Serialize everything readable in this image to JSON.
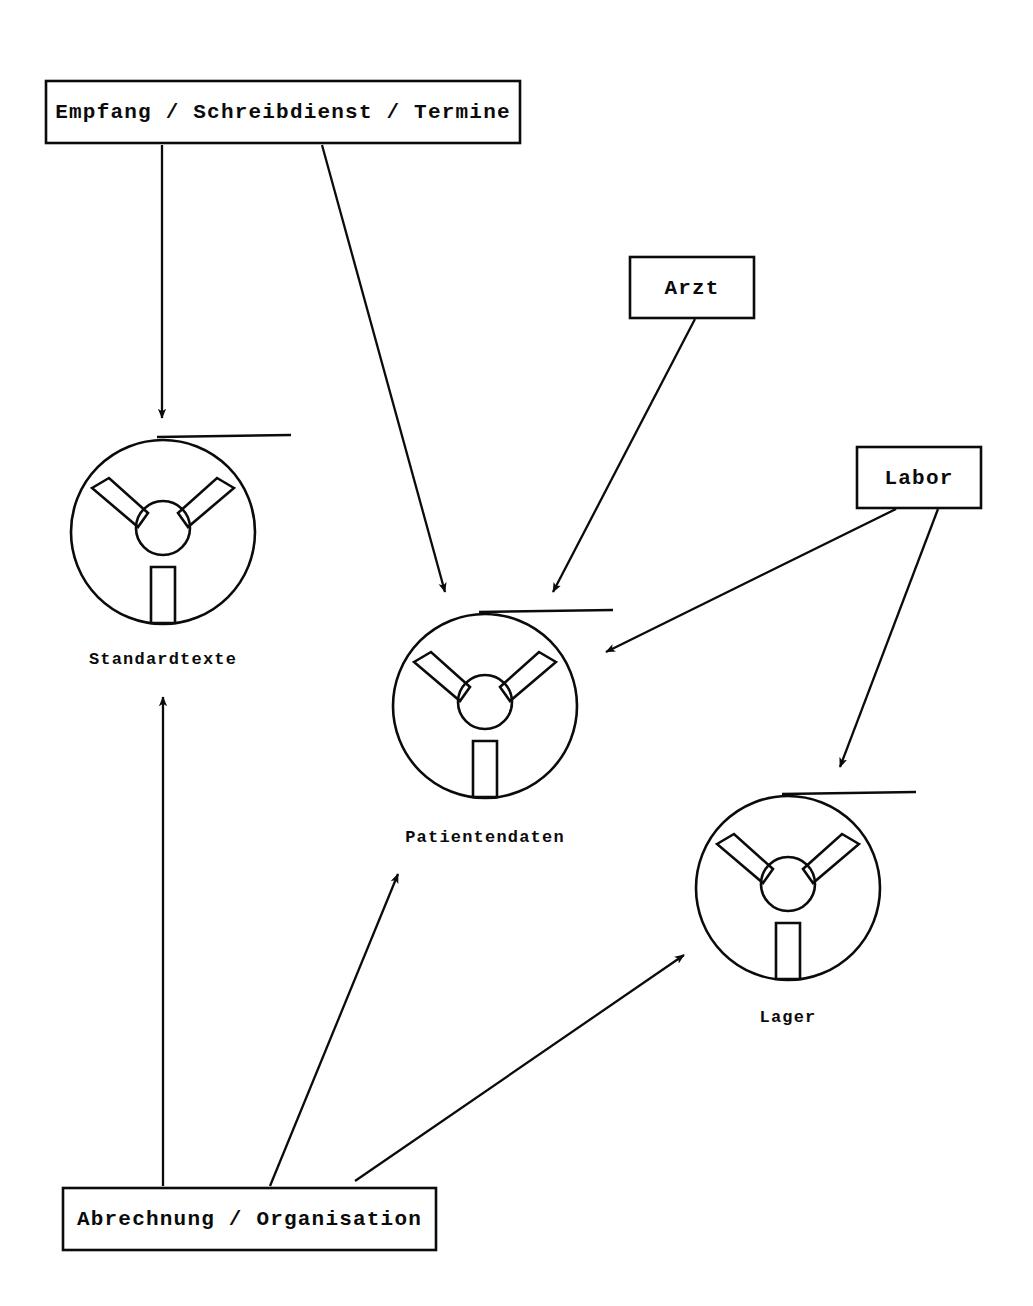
{
  "diagram": {
    "type": "data-flow-diagram",
    "language": "de",
    "background_color": "#ffffff",
    "line_color": "#0b0b0b",
    "processes": [
      {
        "id": "empfang",
        "label": "Empfang / Schreibdienst / Termine",
        "shape": "rectangle",
        "x": 46,
        "y": 81,
        "width": 474,
        "height": 62
      },
      {
        "id": "arzt",
        "label": "Arzt",
        "shape": "rectangle",
        "x": 630,
        "y": 257,
        "width": 124,
        "height": 61
      },
      {
        "id": "labor",
        "label": "Labor",
        "shape": "rectangle",
        "x": 857,
        "y": 447,
        "width": 124,
        "height": 61
      },
      {
        "id": "abrechnung",
        "label": "Abrechnung / Organisation",
        "shape": "rectangle",
        "x": 63,
        "y": 1188,
        "width": 373,
        "height": 62
      }
    ],
    "data_stores": [
      {
        "id": "standardtexte",
        "label": "Standardtexte",
        "shape": "tape-reel",
        "cx": 163,
        "cy": 532,
        "r": 92,
        "tape_from_x": 157,
        "tape_to_x": 291,
        "tape_y": 437,
        "label_x": 163,
        "label_y": 665
      },
      {
        "id": "patientendaten",
        "label": "Patientendaten",
        "shape": "tape-reel",
        "cx": 485,
        "cy": 706,
        "r": 92,
        "tape_from_x": 479,
        "tape_to_x": 613,
        "tape_y": 612,
        "label_x": 485,
        "label_y": 843
      },
      {
        "id": "lager",
        "label": "Lager",
        "shape": "tape-reel",
        "cx": 788,
        "cy": 888,
        "r": 92,
        "tape_from_x": 782,
        "tape_to_x": 916,
        "tape_y": 794,
        "label_x": 788,
        "label_y": 1023
      }
    ],
    "flows": [
      {
        "id": "flow-empfang-standardtexte",
        "from": "empfang",
        "to": "standardtexte",
        "x1": 162,
        "y1": 145,
        "x2": 162,
        "y2": 418
      },
      {
        "id": "flow-empfang-patientendaten",
        "from": "empfang",
        "to": "patientendaten",
        "x1": 322,
        "y1": 145,
        "x2": 445,
        "y2": 592
      },
      {
        "id": "flow-arzt-patientendaten",
        "from": "arzt",
        "to": "patientendaten",
        "x1": 695,
        "y1": 319,
        "x2": 553,
        "y2": 592
      },
      {
        "id": "flow-labor-patientendaten",
        "from": "labor",
        "to": "patientendaten",
        "x1": 896,
        "y1": 509,
        "x2": 606,
        "y2": 652
      },
      {
        "id": "flow-labor-lager",
        "from": "labor",
        "to": "lager",
        "x1": 938,
        "y1": 509,
        "x2": 840,
        "y2": 767
      },
      {
        "id": "flow-abrechnung-standardtexte",
        "from": "abrechnung",
        "to": "standardtexte",
        "x1": 163,
        "y1": 1186,
        "x2": 163,
        "y2": 697
      },
      {
        "id": "flow-abrechnung-patientendaten",
        "from": "abrechnung",
        "to": "patientendaten",
        "x1": 270,
        "y1": 1186,
        "x2": 398,
        "y2": 874
      },
      {
        "id": "flow-abrechnung-lager",
        "from": "abrechnung",
        "to": "lager",
        "x1": 355,
        "y1": 1181,
        "x2": 684,
        "y2": 955
      }
    ]
  }
}
